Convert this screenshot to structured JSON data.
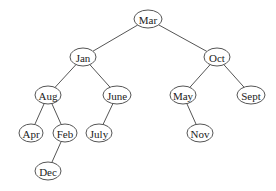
{
  "diagram": {
    "type": "binary-search-tree",
    "style": {
      "stroke": "#555555",
      "fill": "#ffffff",
      "text": "#222222"
    },
    "nodes": [
      {
        "id": "mar",
        "label": "Mar",
        "x": 148,
        "y": 19,
        "rx": 14,
        "ry": 9
      },
      {
        "id": "jan",
        "label": "Jan",
        "x": 83,
        "y": 57,
        "rx": 13,
        "ry": 9
      },
      {
        "id": "oct",
        "label": "Oct",
        "x": 217,
        "y": 57,
        "rx": 13,
        "ry": 9
      },
      {
        "id": "aug",
        "label": "Aug",
        "x": 48,
        "y": 95,
        "rx": 13,
        "ry": 9
      },
      {
        "id": "june",
        "label": "June",
        "x": 117,
        "y": 95,
        "rx": 14,
        "ry": 9
      },
      {
        "id": "may",
        "label": "May",
        "x": 183,
        "y": 95,
        "rx": 13,
        "ry": 9
      },
      {
        "id": "sept",
        "label": "Sept",
        "x": 251,
        "y": 95,
        "rx": 14,
        "ry": 9
      },
      {
        "id": "apr",
        "label": "Apr",
        "x": 31,
        "y": 133,
        "rx": 12,
        "ry": 9
      },
      {
        "id": "feb",
        "label": "Feb",
        "x": 65,
        "y": 133,
        "rx": 12,
        "ry": 9
      },
      {
        "id": "july",
        "label": "July",
        "x": 99,
        "y": 133,
        "rx": 13,
        "ry": 9
      },
      {
        "id": "nov",
        "label": "Nov",
        "x": 200,
        "y": 133,
        "rx": 13,
        "ry": 9
      },
      {
        "id": "dec",
        "label": "Dec",
        "x": 48,
        "y": 171,
        "rx": 13,
        "ry": 9
      }
    ],
    "edges": [
      {
        "from": "mar",
        "to": "jan"
      },
      {
        "from": "mar",
        "to": "oct"
      },
      {
        "from": "jan",
        "to": "aug"
      },
      {
        "from": "jan",
        "to": "june"
      },
      {
        "from": "oct",
        "to": "may"
      },
      {
        "from": "oct",
        "to": "sept"
      },
      {
        "from": "aug",
        "to": "apr"
      },
      {
        "from": "aug",
        "to": "feb"
      },
      {
        "from": "june",
        "to": "july"
      },
      {
        "from": "may",
        "to": "nov"
      },
      {
        "from": "feb",
        "to": "dec"
      }
    ]
  }
}
